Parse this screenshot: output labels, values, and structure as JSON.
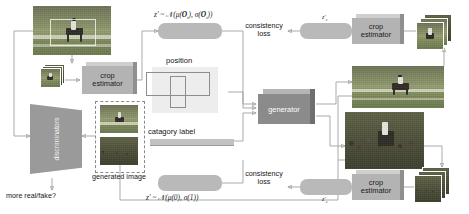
{
  "figure": {
    "type": "architecture-diagram"
  },
  "labels": {
    "crop_estimator": "crop\nestimator",
    "crop_estimator_line1": "crop",
    "crop_estimator_line2": "estimator",
    "generator": "generator",
    "discriminators": "discriminators",
    "position": "position",
    "category_label": "catagory label",
    "generated_image": "generated image",
    "real_fake": "more real/fake?",
    "consistency_loss_line1": "consistency",
    "consistency_loss_line2": "loss"
  },
  "formulas": {
    "top_latent": "z' ~ N(μ(O_t), σ(O_t))",
    "bottom_latent": "z' ~ N(μ(0), σ(1))",
    "z_top_small": "z'",
    "z_bottom_small": "z'"
  },
  "nodes": [
    {
      "id": "real-image",
      "kind": "photo",
      "caption": ""
    },
    {
      "id": "real-crops",
      "kind": "photo-stack",
      "caption": ""
    },
    {
      "id": "crop-estimator-left",
      "kind": "process",
      "label": "crop estimator"
    },
    {
      "id": "latent-top",
      "kind": "latent",
      "label": "z' ~ N(μ(O_t), σ(O_t))"
    },
    {
      "id": "position",
      "kind": "input",
      "label": "position"
    },
    {
      "id": "category-label",
      "kind": "input",
      "label": "catagory label"
    },
    {
      "id": "generator",
      "kind": "process",
      "label": "generator"
    },
    {
      "id": "generated-top",
      "kind": "photo",
      "caption": ""
    },
    {
      "id": "generated-bottom",
      "kind": "photo",
      "caption": ""
    },
    {
      "id": "crop-estimator-top-right",
      "kind": "process",
      "label": "crop estimator"
    },
    {
      "id": "crop-estimator-bottom-right",
      "kind": "process",
      "label": "crop estimator"
    },
    {
      "id": "latent-bottom",
      "kind": "latent",
      "label": "z' ~ N(μ(0), σ(1))"
    },
    {
      "id": "consistency-loss-top",
      "kind": "loss",
      "label": "consistency loss"
    },
    {
      "id": "consistency-loss-bottom",
      "kind": "loss",
      "label": "consistency loss"
    },
    {
      "id": "discriminators",
      "kind": "process",
      "label": "discriminators"
    },
    {
      "id": "generated-image-pair",
      "kind": "photo-pair",
      "label": "generated image"
    },
    {
      "id": "output",
      "kind": "output",
      "label": "more real/fake?"
    }
  ],
  "colors": {
    "latent_pill": "#b9b9b9",
    "process_box": "#b3b3b3",
    "generator_box": "#8b8b8b",
    "discriminator": "#9a9a9a",
    "position_panel": "#ededed",
    "category_bar": "#c2c2c2",
    "wire": "#9b9b9b",
    "text": "#161616",
    "background": "#ffffff"
  }
}
